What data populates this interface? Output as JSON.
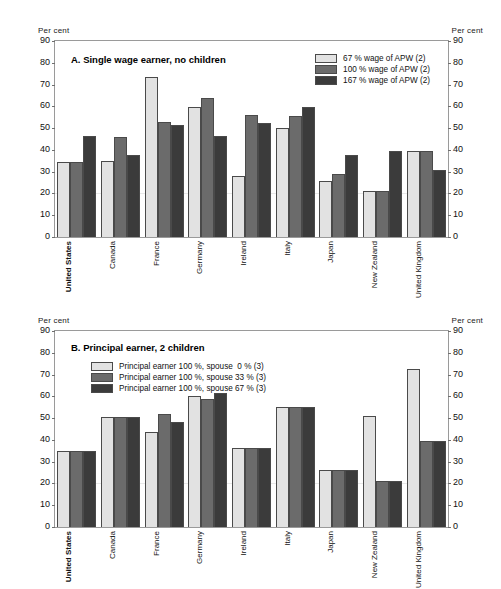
{
  "units": {
    "left": "Per cent",
    "right": "Per cent"
  },
  "chart_data": [
    {
      "type": "bar",
      "panel": "A",
      "title": "A. Single wage earner, no children",
      "ylabel": "Per cent",
      "xlabel": "",
      "ylim": [
        0,
        90
      ],
      "yticks": [
        0,
        10,
        20,
        30,
        40,
        50,
        60,
        70,
        80,
        90
      ],
      "grid": false,
      "legend_position": "top-right",
      "categories": [
        "United States",
        "Canada",
        "France",
        "Germany",
        "Ireland",
        "Italy",
        "Japan",
        "New Zealand",
        "United Kingdom"
      ],
      "series": [
        {
          "name": "67 % wage of APW (2)",
          "color": "#e2e2e2",
          "values": [
            34.5,
            35.0,
            73.5,
            59.5,
            28.0,
            50.0,
            25.5,
            21.0,
            39.5
          ]
        },
        {
          "name": "100 % wage of APW (2)",
          "color": "#6b6b6b",
          "values": [
            34.5,
            46.0,
            53.0,
            64.0,
            56.0,
            55.5,
            29.0,
            21.0,
            39.5
          ]
        },
        {
          "name": "167 % wage of APW (2)",
          "color": "#3b3b3b",
          "values": [
            46.5,
            37.5,
            51.5,
            46.5,
            52.5,
            59.5,
            37.5,
            39.5,
            31.0
          ]
        }
      ]
    },
    {
      "type": "bar",
      "panel": "B",
      "title": "B. Principal earner, 2 children",
      "ylabel": "Per cent",
      "xlabel": "",
      "ylim": [
        0,
        90
      ],
      "yticks": [
        0,
        10,
        20,
        30,
        40,
        50,
        60,
        70,
        80,
        90
      ],
      "grid": false,
      "legend_position": "top-left",
      "categories": [
        "United States",
        "Canada",
        "France",
        "Germany",
        "Ireland",
        "Italy",
        "Japan",
        "New Zealand",
        "United Kingdom"
      ],
      "series": [
        {
          "name": "Principal earner 100 %, spouse  0 % (3)",
          "color": "#e2e2e2",
          "values": [
            35.0,
            50.5,
            43.5,
            60.0,
            36.5,
            55.0,
            26.0,
            51.0,
            72.5
          ]
        },
        {
          "name": "Principal earner 100 %, spouse 33 % (3)",
          "color": "#6b6b6b",
          "values": [
            35.0,
            50.5,
            52.0,
            59.0,
            36.5,
            55.0,
            26.0,
            21.0,
            39.5
          ]
        },
        {
          "name": "Principal earner 100 %, spouse 67 % (3)",
          "color": "#3b3b3b",
          "values": [
            35.0,
            50.5,
            48.0,
            61.5,
            36.5,
            55.0,
            26.0,
            21.0,
            39.5
          ]
        }
      ]
    }
  ]
}
